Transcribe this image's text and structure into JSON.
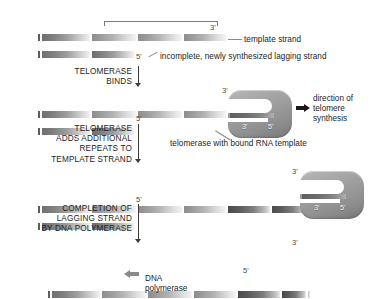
{
  "figure": {
    "annotations": {
      "template_strand": "template strand",
      "lagging_strand": "incomplete, newly synthesized lagging strand",
      "telomerase_caption": "telomerase with bound RNA template",
      "direction_line1": "direction of",
      "direction_line2": "telomere",
      "direction_line3": "synthesis",
      "dna_pol_line1": "DNA",
      "dna_pol_line2": "polymerase"
    },
    "primes": {
      "three": "3'",
      "five": "5'"
    },
    "steps": [
      {
        "id": "telomerase-binds",
        "lines": [
          "TELOMERASE",
          "BINDS"
        ]
      },
      {
        "id": "telomerase-adds-repeats",
        "lines": [
          "TELOMERASE",
          "ADDS ADDITIONAL",
          "REPEATS TO",
          "TEMPLATE STRAND"
        ]
      },
      {
        "id": "completion-lagging-strand",
        "lines": [
          "COMPLETION OF",
          "LAGGING STRAND",
          "BY DNA POLYMERASE"
        ]
      }
    ],
    "stages": [
      {
        "id": "stage-1-shortened-telomere",
        "has_enzyme": false
      },
      {
        "id": "stage-2-telomerase-bound",
        "has_enzyme": true
      },
      {
        "id": "stage-3-extended-template",
        "has_enzyme": true
      },
      {
        "id": "stage-4-completed-duplex",
        "has_enzyme": false
      }
    ],
    "enzyme_primes": {
      "three": "3'",
      "five": "5'"
    },
    "colors": {
      "background": "#ffffff",
      "text": "#1d1d1d",
      "strand_dark": "#5a5a5a",
      "strand_light": "#dcdcdc",
      "enzyme_fill": "#9a9a9a",
      "arrow_dark": "#1a1a1a",
      "arrow_gray": "#8a8a8a"
    }
  }
}
